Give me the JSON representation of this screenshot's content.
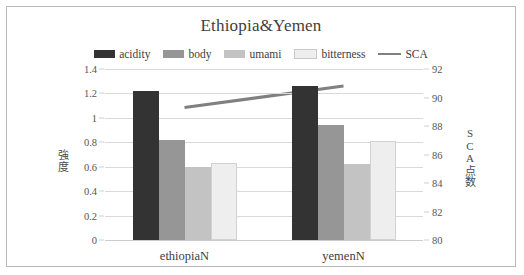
{
  "chart_data": {
    "type": "bar",
    "title": "Ethiopia&Yemen",
    "categories": [
      "ethiopiaN",
      "yemenN"
    ],
    "series": [
      {
        "name": "acidity",
        "values": [
          1.22,
          1.26
        ],
        "color": "#333333",
        "axis": "left"
      },
      {
        "name": "body",
        "values": [
          0.82,
          0.94
        ],
        "color": "#969696",
        "axis": "left"
      },
      {
        "name": "umami",
        "values": [
          0.6,
          0.62
        ],
        "color": "#c3c3c3",
        "axis": "left"
      },
      {
        "name": "bitterness",
        "values": [
          0.63,
          0.81
        ],
        "color": "#eeeeee",
        "axis": "left"
      }
    ],
    "line_series": [
      {
        "name": "SCA",
        "values": [
          89.3,
          90.8
        ],
        "color": "#808080",
        "axis": "right"
      }
    ],
    "xlabel": "",
    "ylabel": "強度",
    "ylabel_secondary": "SCA点数",
    "ylim": [
      0,
      1.4
    ],
    "ylim_secondary": [
      80,
      92
    ],
    "yticks": [
      "1.4",
      "1.2",
      "1",
      "0.8",
      "0.6",
      "0.4",
      "0.2",
      "0"
    ],
    "ytick_values": [
      1.4,
      1.2,
      1.0,
      0.8,
      0.6,
      0.4,
      0.2,
      0
    ],
    "yticks_secondary": [
      "92",
      "90",
      "88",
      "86",
      "84",
      "82",
      "80"
    ],
    "ytick_values_secondary": [
      92,
      90,
      88,
      86,
      84,
      82,
      80
    ],
    "grid": true,
    "legend_position": "top"
  },
  "legend": {
    "items": [
      {
        "label": "acidity",
        "color": "#333333",
        "marker": "swatch"
      },
      {
        "label": "body",
        "color": "#969696",
        "marker": "swatch"
      },
      {
        "label": "umami",
        "color": "#c3c3c3",
        "marker": "swatch"
      },
      {
        "label": "bitterness",
        "color": "#eeeeee",
        "marker": "swatch"
      },
      {
        "label": "SCA",
        "color": "#808080",
        "marker": "line"
      }
    ]
  }
}
